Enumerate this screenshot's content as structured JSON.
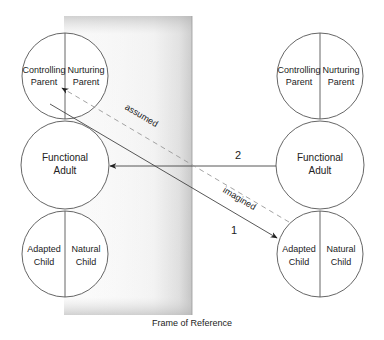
{
  "frame": {
    "label": "Frame of Reference"
  },
  "left_ego": {
    "parent": {
      "left": [
        "Controlling",
        "Parent"
      ],
      "right": [
        "Nurturing",
        "Parent"
      ]
    },
    "adult": [
      "Functional",
      "Adult"
    ],
    "child": {
      "left": [
        "Adapted",
        "Child"
      ],
      "right": [
        "Natural",
        "Child"
      ]
    }
  },
  "right_ego": {
    "parent": {
      "left": [
        "Controlling",
        "Parent"
      ],
      "right": [
        "Nurturing",
        "Parent"
      ]
    },
    "adult": [
      "Functional",
      "Adult"
    ],
    "child": {
      "left": [
        "Adapted",
        "Child"
      ],
      "right": [
        "Natural",
        "Child"
      ]
    }
  },
  "transactions": {
    "t1": {
      "label": "1",
      "from": "left Parent",
      "to": "right Adapted Child",
      "style": "solid"
    },
    "t2": {
      "label": "2",
      "from": "right Functional Adult",
      "to": "left Functional Adult",
      "style": "solid"
    },
    "assumed": {
      "label": "assumed",
      "style": "dashed"
    },
    "imagined": {
      "label": "imagined",
      "style": "dashed"
    }
  },
  "colors": {
    "stroke": "#555555",
    "dashed": "#999999",
    "frame_light": "#ffffff",
    "frame_dark": "#b8b8b8"
  }
}
